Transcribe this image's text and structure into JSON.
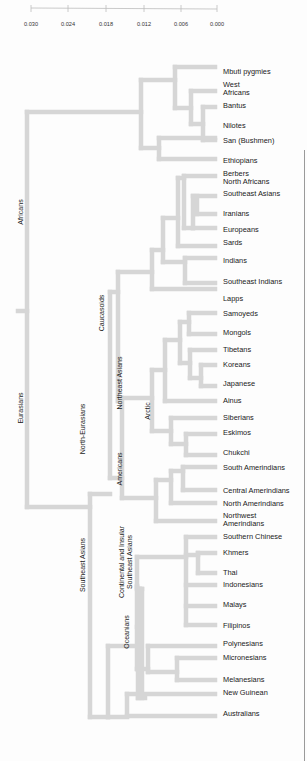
{
  "axis": {
    "ticks": [
      "0.030",
      "0.024",
      "0.018",
      "0.012",
      "0.006",
      "0.000"
    ],
    "tick_x": [
      31,
      68,
      106,
      144,
      181,
      217
    ]
  },
  "chart_data": {
    "type": "dendrogram",
    "title": "",
    "xlabel": "Genetic distance",
    "xlim": [
      0.03,
      0.0
    ],
    "leaves": [
      "Mbuti pygmies",
      "West Africans",
      "Bantus",
      "Nilotes",
      "San (Bushmen)",
      "Ethiopians",
      "Berbers North Africans",
      "Southeast Asians",
      "Iranians",
      "Europeans",
      "Sards",
      "Indians",
      "Southeast Indians",
      "Lapps",
      "Samoyeds",
      "Mongols",
      "Tibetans",
      "Koreans",
      "Japanese",
      "Ainus",
      "Siberians",
      "Eskimos",
      "Chukchi",
      "South Amerindians",
      "Central Amerindians",
      "North Amerindians",
      "Northwest Amerindians",
      "Southern Chinese",
      "Khmers",
      "Thai",
      "Indonesians",
      "Malays",
      "Filipinos",
      "Polynesians",
      "Micronesians",
      "Melanesians",
      "New Guinean",
      "Australians"
    ],
    "clusters": [
      "Africans",
      "Eurasians",
      "Caucasoids",
      "North-Eurasians",
      "Northeast Asians",
      "Arctic",
      "Americans",
      "Southeast Asians",
      "Continental and Insular Southeast Asians",
      "Oceanians"
    ]
  },
  "leaves": [
    {
      "label": "Mbuti pygmies",
      "y": 72
    },
    {
      "label": "West\nAfricans",
      "y": 89
    },
    {
      "label": "Bantus",
      "y": 106
    },
    {
      "label": "Nilotes",
      "y": 126
    },
    {
      "label": "San (Bushmen)",
      "y": 141
    },
    {
      "label": "Ethiopians",
      "y": 161
    },
    {
      "label": "Berbers\nNorth Africans",
      "y": 178
    },
    {
      "label": "Southeast Asians",
      "y": 194
    },
    {
      "label": "Iranians",
      "y": 214
    },
    {
      "label": "Europeans",
      "y": 230
    },
    {
      "label": "Sards",
      "y": 243
    },
    {
      "label": "Indians",
      "y": 261
    },
    {
      "label": "Southeast Indians",
      "y": 282
    },
    {
      "label": "Lapps",
      "y": 299
    },
    {
      "label": "Samoyeds",
      "y": 314
    },
    {
      "label": "Mongols",
      "y": 333
    },
    {
      "label": "Tibetans",
      "y": 350
    },
    {
      "label": "Koreans",
      "y": 365
    },
    {
      "label": "Japanese",
      "y": 384
    },
    {
      "label": "Ainus",
      "y": 401
    },
    {
      "label": "Siberians",
      "y": 418
    },
    {
      "label": "Eskimos",
      "y": 433
    },
    {
      "label": "Chukchi",
      "y": 453
    },
    {
      "label": "South Amerindians",
      "y": 468
    },
    {
      "label": "Central Amerindians",
      "y": 491
    },
    {
      "label": "North Amerindians",
      "y": 504
    },
    {
      "label": "Northwest\nAmerindians",
      "y": 520
    },
    {
      "label": "Southern Chinese",
      "y": 537
    },
    {
      "label": "Khmers",
      "y": 553
    },
    {
      "label": "Thai",
      "y": 573
    },
    {
      "label": "Indonesians",
      "y": 585
    },
    {
      "label": "Malays",
      "y": 605
    },
    {
      "label": "Filipinos",
      "y": 626
    },
    {
      "label": "Polynesians",
      "y": 644
    },
    {
      "label": "Micronesians",
      "y": 658
    },
    {
      "label": "Melanesians",
      "y": 680
    },
    {
      "label": "New Guinean",
      "y": 693
    },
    {
      "label": "Australians",
      "y": 714
    }
  ],
  "groups": [
    {
      "label": "Africans",
      "x": 21,
      "y": 212
    },
    {
      "label": "Eurasians",
      "x": 21,
      "y": 408
    },
    {
      "label": "Caucasoids",
      "x": 102,
      "y": 313
    },
    {
      "label": "North-Eurasians",
      "x": 83,
      "y": 429
    },
    {
      "label": "Northeast Asians",
      "x": 120,
      "y": 383
    },
    {
      "label": "Arctic",
      "x": 148,
      "y": 411
    },
    {
      "label": "Americans",
      "x": 120,
      "y": 469
    },
    {
      "label": "Southeast Asians",
      "x": 83,
      "y": 565
    },
    {
      "label": "Continental and Insular\nSoutheast Asians",
      "x": 126,
      "y": 562
    },
    {
      "label": "Oceanians",
      "x": 127,
      "y": 632
    }
  ],
  "style": {
    "branch_color": "#d9d9d9",
    "text_color": "#1a1a1a"
  }
}
